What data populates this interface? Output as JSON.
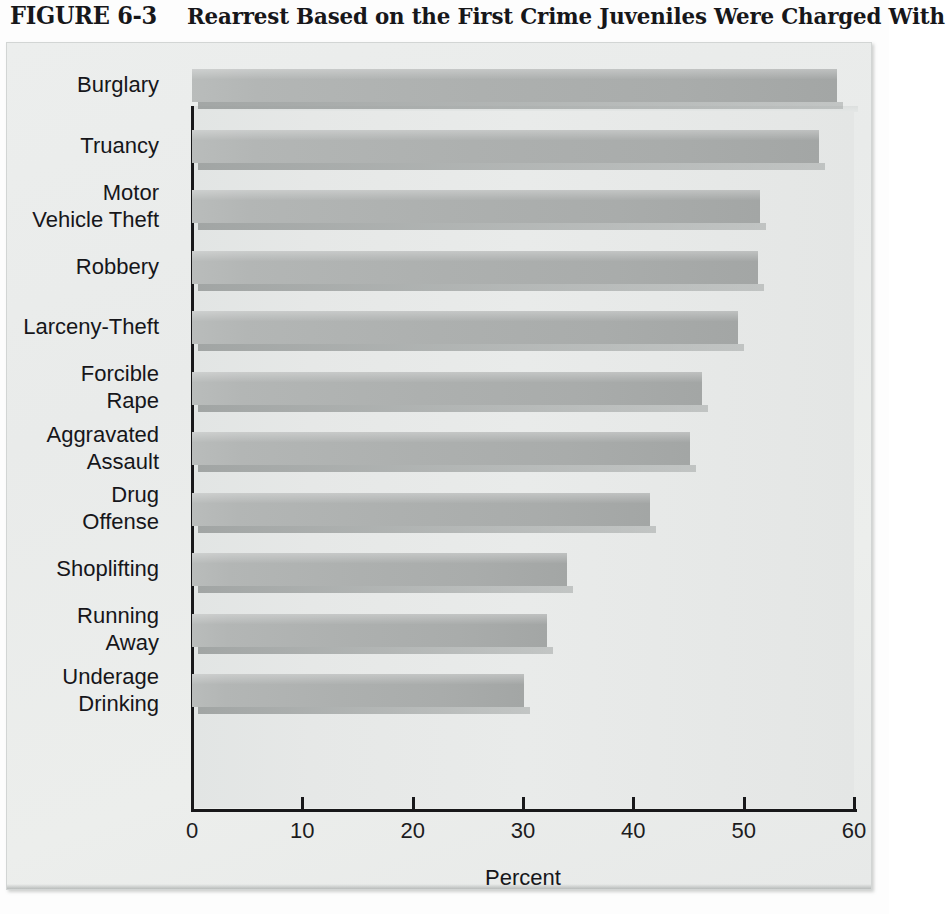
{
  "figure": {
    "number": "FIGURE 6-3",
    "caption": "Rearrest Based on the First Crime Juveniles Were Charged With"
  },
  "chart_data": {
    "type": "bar",
    "orientation": "horizontal",
    "title": "Rearrest Based on the First Crime Juveniles Were Charged With",
    "xlabel": "Percent",
    "ylabel": "",
    "xlim": [
      0,
      60
    ],
    "xticks": [
      0,
      10,
      20,
      30,
      40,
      50,
      60
    ],
    "xtick_labels": [
      "0",
      "10",
      "20",
      "30",
      "40",
      "50",
      "60"
    ],
    "grid": false,
    "legend": "none",
    "categories": [
      "Burglary",
      "Truancy",
      "Motor\nVehicle Theft",
      "Robbery",
      "Larceny-Theft",
      "Forcible\nRape",
      "Aggravated\nAssault",
      "Drug\nOffense",
      "Shoplifting",
      "Running\nAway",
      "Underage\nDrinking"
    ],
    "values": [
      58.5,
      56.8,
      51.5,
      51.3,
      49.5,
      46.2,
      45.1,
      41.5,
      34.0,
      32.2,
      30.1
    ],
    "bar_color": "#adb0af",
    "plot_background": "#e7e9e8",
    "panel_background": "#eceeed"
  }
}
